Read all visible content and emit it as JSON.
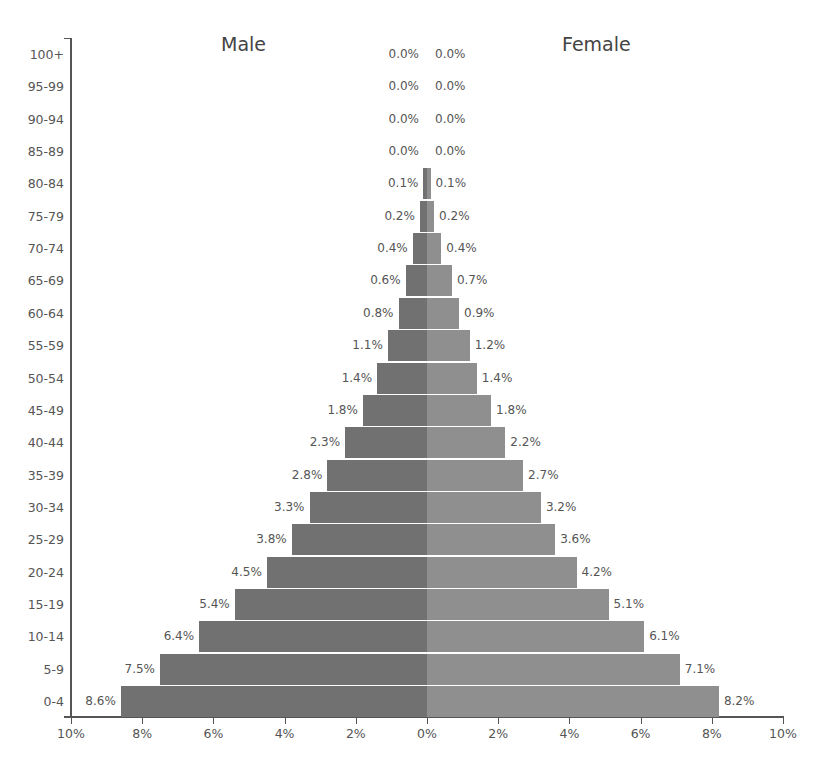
{
  "chart_data": {
    "type": "bar",
    "subtype": "population-pyramid",
    "titles": {
      "left": "Male",
      "right": "Female"
    },
    "categories": [
      "100+",
      "95-99",
      "90-94",
      "85-89",
      "80-84",
      "75-79",
      "70-74",
      "65-69",
      "60-64",
      "55-59",
      "50-54",
      "45-49",
      "40-44",
      "35-39",
      "30-34",
      "25-29",
      "20-24",
      "15-19",
      "10-14",
      "5-9",
      "0-4"
    ],
    "series": [
      {
        "name": "Male",
        "color": "#717171",
        "values": [
          0.0,
          0.0,
          0.0,
          0.0,
          0.1,
          0.2,
          0.4,
          0.6,
          0.8,
          1.1,
          1.4,
          1.8,
          2.3,
          2.8,
          3.3,
          3.8,
          4.5,
          5.4,
          6.4,
          7.5,
          8.6
        ],
        "labels": [
          "0.0%",
          "0.0%",
          "0.0%",
          "0.0%",
          "0.1%",
          "0.2%",
          "0.4%",
          "0.6%",
          "0.8%",
          "1.1%",
          "1.4%",
          "1.8%",
          "2.3%",
          "2.8%",
          "3.3%",
          "3.8%",
          "4.5%",
          "5.4%",
          "6.4%",
          "7.5%",
          "8.6%"
        ]
      },
      {
        "name": "Female",
        "color": "#8f8f8f",
        "values": [
          0.0,
          0.0,
          0.0,
          0.0,
          0.1,
          0.2,
          0.4,
          0.7,
          0.9,
          1.2,
          1.4,
          1.8,
          2.2,
          2.7,
          3.2,
          3.6,
          4.2,
          5.1,
          6.1,
          7.1,
          8.2
        ],
        "labels": [
          "0.0%",
          "0.0%",
          "0.0%",
          "0.0%",
          "0.1%",
          "0.2%",
          "0.4%",
          "0.7%",
          "0.9%",
          "1.2%",
          "1.4%",
          "1.8%",
          "2.2%",
          "2.7%",
          "3.2%",
          "3.6%",
          "4.2%",
          "5.1%",
          "6.1%",
          "7.1%",
          "8.2%"
        ]
      }
    ],
    "x_ticks": [
      "10%",
      "8%",
      "6%",
      "4%",
      "2%",
      "0%",
      "2%",
      "4%",
      "6%",
      "8%",
      "10%"
    ],
    "xlim": [
      -10,
      10
    ],
    "xlabel": "",
    "ylabel": "",
    "grid": false,
    "legend": "none"
  }
}
